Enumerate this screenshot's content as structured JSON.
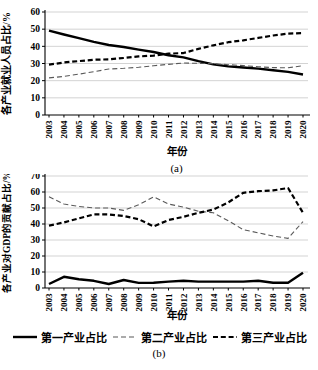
{
  "figure": {
    "background": "#ffffff"
  },
  "colors": {
    "axis": "#000000",
    "grid": "#c8c8c8",
    "text": "#000000"
  },
  "legend": {
    "items": [
      {
        "label": "第一产业占比",
        "style": "solid",
        "color": "#000000"
      },
      {
        "label": "第二产业占比",
        "style": "dashed-thin",
        "color": "#595959"
      },
      {
        "label": "第三产业占比",
        "style": "dashed-bold",
        "color": "#000000"
      }
    ]
  },
  "chart_data": [
    {
      "id": "a",
      "type": "line",
      "subplot_label": "(a)",
      "xlabel": "年份",
      "ylabel": "各产业就业人员占比/%",
      "ylim": [
        0,
        60
      ],
      "ytick_step": 10,
      "grid": "horizontal",
      "legend_position": "shared-bottom",
      "categories": [
        "2003",
        "2004",
        "2005",
        "2006",
        "2007",
        "2008",
        "2009",
        "2010",
        "2011",
        "2012",
        "2013",
        "2014",
        "2015",
        "2016",
        "2017",
        "2018",
        "2019",
        "2020"
      ],
      "series": [
        {
          "name": "第一产业占比",
          "style": "solid",
          "color": "#000000",
          "values": [
            49.1,
            46.9,
            44.8,
            42.6,
            40.8,
            39.6,
            38.1,
            36.7,
            34.8,
            33.6,
            31.4,
            29.5,
            28.3,
            27.7,
            27.0,
            26.1,
            25.1,
            23.6
          ]
        },
        {
          "name": "第二产业占比",
          "style": "dashed-thin",
          "color": "#595959",
          "values": [
            21.6,
            22.5,
            23.8,
            25.2,
            26.8,
            27.2,
            27.8,
            28.7,
            29.5,
            30.3,
            30.1,
            29.9,
            29.3,
            28.8,
            28.1,
            27.6,
            27.5,
            28.7
          ]
        },
        {
          "name": "第三产业占比",
          "style": "dashed-bold",
          "color": "#000000",
          "values": [
            29.3,
            30.6,
            31.4,
            32.2,
            32.4,
            33.2,
            34.1,
            34.6,
            35.7,
            36.1,
            38.5,
            40.6,
            42.4,
            43.5,
            44.9,
            46.3,
            47.4,
            47.7
          ]
        }
      ]
    },
    {
      "id": "b",
      "type": "line",
      "subplot_label": "(b)",
      "xlabel": "年份",
      "ylabel": "各产业对GDP的贡献占比/%",
      "ylim": [
        0,
        70
      ],
      "ytick_step": 10,
      "grid": "horizontal",
      "legend_position": "shared-bottom",
      "categories": [
        "2003",
        "2004",
        "2005",
        "2006",
        "2007",
        "2008",
        "2009",
        "2010",
        "2011",
        "2012",
        "2013",
        "2014",
        "2015",
        "2016",
        "2017",
        "2018",
        "2019",
        "2020"
      ],
      "series": [
        {
          "name": "第一产业占比",
          "style": "solid",
          "color": "#000000",
          "values": [
            2.5,
            7.0,
            5.5,
            4.5,
            2.5,
            5.0,
            3.2,
            3.3,
            4.0,
            4.5,
            4.0,
            4.0,
            4.0,
            4.0,
            4.5,
            3.3,
            3.3,
            9.5
          ]
        },
        {
          "name": "第二产业占比",
          "style": "dashed-thin",
          "color": "#595959",
          "values": [
            57.0,
            52.5,
            51.0,
            50.0,
            50.0,
            48.5,
            52.0,
            57.0,
            52.5,
            50.5,
            48.0,
            47.0,
            42.0,
            36.5,
            34.5,
            32.5,
            31.0,
            41.5
          ]
        },
        {
          "name": "第三产业占比",
          "style": "dashed-bold",
          "color": "#000000",
          "values": [
            39.0,
            41.0,
            43.5,
            46.0,
            46.0,
            45.0,
            43.0,
            38.5,
            42.5,
            44.5,
            47.0,
            49.0,
            53.5,
            59.5,
            60.5,
            61.0,
            62.5,
            47.0
          ]
        }
      ]
    }
  ]
}
